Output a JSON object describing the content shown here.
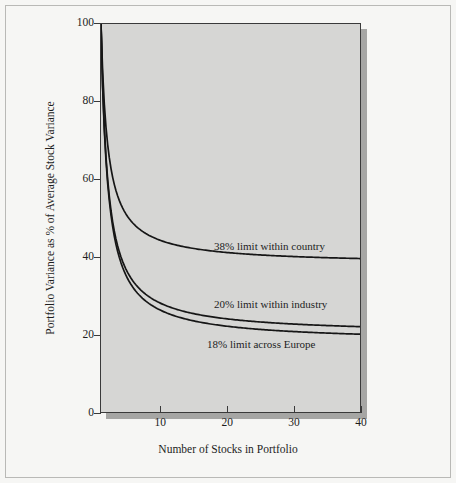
{
  "figure": {
    "background_color": "#f6f6f4",
    "plot_background_color": "#d6d6d4",
    "axis_color": "#3a3a3a",
    "curve_color": "#161616"
  },
  "chart_data": {
    "type": "line",
    "title": "",
    "xlabel": "Number of Stocks in Portfolio",
    "ylabel": "Portfolio Variance as % of Average Stock Variance",
    "xlim": [
      1,
      40
    ],
    "ylim": [
      0,
      100
    ],
    "xticks": [
      10,
      20,
      30,
      40
    ],
    "yticks": [
      0,
      20,
      40,
      60,
      80,
      100
    ],
    "grid": false,
    "legend_position": "inline-annotations",
    "annotations": [
      {
        "text": "38% limit within country",
        "x": 22,
        "y": 44
      },
      {
        "text": "20% limit within industry",
        "x": 22,
        "y": 27
      },
      {
        "text": "18% limit across Europe",
        "x": 21,
        "y": 19
      }
    ],
    "series": [
      {
        "name": "38% limit within country",
        "limit": 38,
        "x": [
          1,
          2,
          3,
          4,
          5,
          6,
          7,
          8,
          9,
          10,
          12,
          14,
          16,
          18,
          20,
          24,
          28,
          32,
          36,
          40
        ],
        "values": [
          100,
          69.0,
          58.7,
          53.5,
          50.4,
          48.3,
          46.9,
          45.8,
          44.9,
          44.2,
          43.2,
          42.4,
          41.9,
          41.4,
          41.1,
          40.6,
          40.2,
          39.9,
          39.7,
          39.6
        ]
      },
      {
        "name": "20% limit within industry",
        "limit": 20,
        "x": [
          1,
          2,
          3,
          4,
          5,
          6,
          7,
          8,
          9,
          10,
          12,
          14,
          16,
          18,
          20,
          24,
          28,
          32,
          36,
          40
        ],
        "values": [
          100,
          60.0,
          46.7,
          40.0,
          36.0,
          33.3,
          31.4,
          30.0,
          28.9,
          28.0,
          26.7,
          25.7,
          25.0,
          24.4,
          24.0,
          23.3,
          22.9,
          22.5,
          22.2,
          22.0
        ]
      },
      {
        "name": "18% limit across Europe",
        "limit": 18,
        "x": [
          1,
          2,
          3,
          4,
          5,
          6,
          7,
          8,
          9,
          10,
          12,
          14,
          16,
          18,
          20,
          24,
          28,
          32,
          36,
          40
        ],
        "values": [
          100,
          59.0,
          45.3,
          38.5,
          34.4,
          31.7,
          29.7,
          28.3,
          27.1,
          26.2,
          24.8,
          23.9,
          23.1,
          22.6,
          22.1,
          21.4,
          20.9,
          20.6,
          20.3,
          20.1
        ]
      }
    ]
  }
}
